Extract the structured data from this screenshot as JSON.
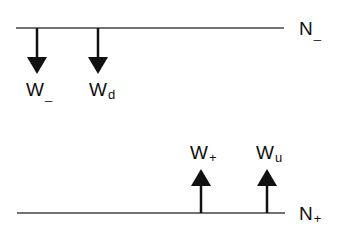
{
  "diagram": {
    "levels": [
      {
        "id": "n_minus",
        "label": "N",
        "sub": "_",
        "y": 28,
        "x1": 16,
        "x2": 284
      },
      {
        "id": "n_plus",
        "label": "N",
        "sub": "+",
        "y": 213,
        "x1": 17,
        "x2": 285
      }
    ],
    "arrows": [
      {
        "id": "w_minus",
        "direction": "down",
        "x": 37,
        "label": "W",
        "sub": "_"
      },
      {
        "id": "w_d",
        "direction": "down",
        "x": 98,
        "label": "W",
        "sub": "d"
      },
      {
        "id": "w_plus",
        "direction": "up",
        "x": 201,
        "label": "W",
        "sub": "+"
      },
      {
        "id": "w_u",
        "direction": "up",
        "x": 267,
        "label": "W",
        "sub": "u"
      }
    ],
    "colors": {
      "line": "#333333",
      "arrow": "#111111"
    }
  }
}
